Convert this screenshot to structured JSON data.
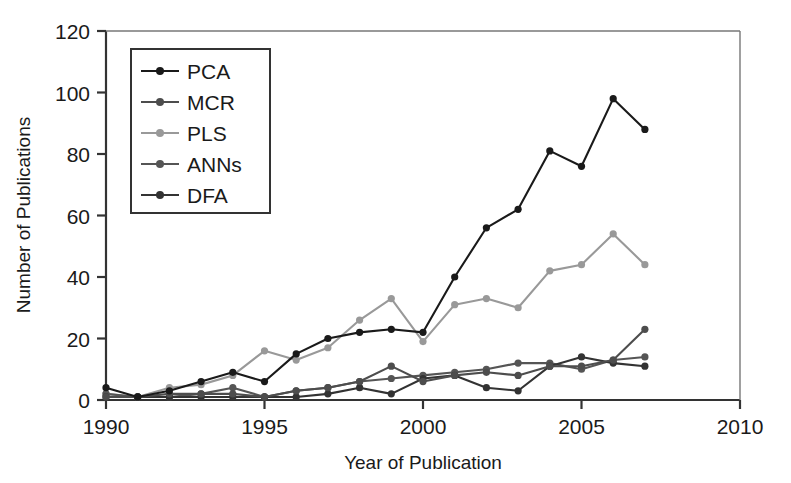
{
  "chart_data": {
    "type": "line",
    "title": "",
    "xlabel": "Year of Publication",
    "ylabel": "Number of Publications",
    "xlim": [
      1990,
      2010
    ],
    "ylim": [
      0,
      120
    ],
    "xticks": [
      1990,
      1995,
      2000,
      2005,
      2010
    ],
    "yticks": [
      0,
      20,
      40,
      60,
      80,
      100,
      120
    ],
    "grid": false,
    "legend_position": "upper-left-inside",
    "x": [
      1990,
      1991,
      1992,
      1993,
      1994,
      1995,
      1996,
      1997,
      1998,
      1999,
      2000,
      2001,
      2002,
      2003,
      2004,
      2005,
      2006,
      2007
    ],
    "series": [
      {
        "name": "PCA",
        "color": "#1a1a1a",
        "values": [
          4,
          1,
          3,
          6,
          9,
          6,
          15,
          20,
          22,
          23,
          22,
          40,
          56,
          62,
          81,
          76,
          98,
          88
        ]
      },
      {
        "name": "MCR",
        "color": "#4d4d4d",
        "values": [
          1,
          1,
          2,
          2,
          2,
          1,
          3,
          4,
          6,
          11,
          6,
          8,
          9,
          8,
          11,
          11,
          13,
          23
        ]
      },
      {
        "name": "PLS",
        "color": "#999999",
        "values": [
          2,
          1,
          4,
          5,
          8,
          16,
          13,
          17,
          26,
          33,
          19,
          31,
          33,
          30,
          42,
          44,
          54,
          44
        ]
      },
      {
        "name": "ANNs",
        "color": "#555555",
        "values": [
          2,
          1,
          1,
          2,
          4,
          1,
          3,
          4,
          6,
          7,
          8,
          9,
          10,
          12,
          12,
          10,
          13,
          14
        ]
      },
      {
        "name": "DFA",
        "color": "#333333",
        "values": [
          1,
          1,
          1,
          1,
          1,
          1,
          1,
          2,
          4,
          2,
          7,
          8,
          4,
          3,
          11,
          14,
          12,
          11
        ]
      }
    ]
  },
  "legend": {
    "entries": [
      {
        "label": "PCA"
      },
      {
        "label": "MCR"
      },
      {
        "label": "PLS"
      },
      {
        "label": "ANNs"
      },
      {
        "label": "DFA"
      }
    ]
  }
}
